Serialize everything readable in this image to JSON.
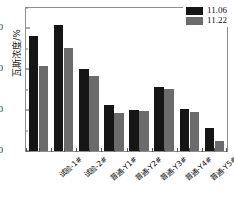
{
  "chart_data": {
    "type": "bar",
    "title": "",
    "xlabel": "",
    "ylabel": "瓦斯浓度/%",
    "ylim": [
      0,
      70
    ],
    "yticks": [
      0,
      20,
      40,
      60
    ],
    "ytick_labels": [
      "0",
      "20",
      "40",
      "60"
    ],
    "yminor_ticks": [
      10,
      30,
      50,
      70
    ],
    "grid": false,
    "legend_position": "top-right",
    "categories": [
      "试验-1#",
      "试验-2#",
      "普通-Y1#",
      "普通-Y2#",
      "普通-Y3#",
      "普通-Y4#",
      "普通-Y5#",
      "普通-Y6#"
    ],
    "series": [
      {
        "name": "11.06",
        "color": "#151515",
        "values": [
          56.5,
          61.5,
          40.0,
          22.5,
          20.0,
          31.5,
          20.5,
          11.5
        ]
      },
      {
        "name": "11.22",
        "color": "#6b6b6b",
        "values": [
          41.5,
          50.5,
          36.5,
          18.5,
          19.5,
          30.5,
          19.0,
          5.0
        ]
      }
    ]
  },
  "legend": {
    "items": [
      {
        "label": "11.06",
        "swatch": "s0"
      },
      {
        "label": "11.22",
        "swatch": "s1"
      }
    ]
  },
  "colors": {
    "series_1": "#151515",
    "series_2": "#6b6b6b",
    "axis": "#8e8e8e",
    "text": "#111111",
    "background": "#ffffff"
  }
}
